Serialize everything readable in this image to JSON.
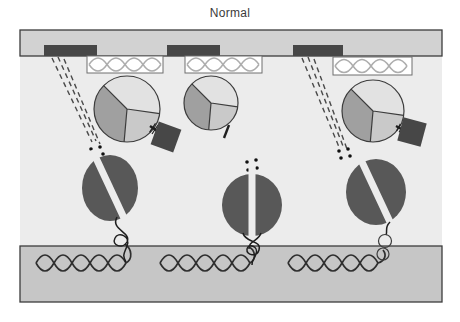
{
  "title": "Normal",
  "colors": {
    "page": "#ffffff",
    "interior": "#ececec",
    "membrane-bar": "#d2d2d2",
    "nucleus-bar": "#c6c6c6",
    "outline": "#3c3c3c",
    "dark-element": "#474747",
    "ribosome": "#585858",
    "pie-top": "#e2e2e2",
    "pie-left": "#a0a0a0",
    "pie-bottom": "#c9c9c9",
    "wave": "#adadad",
    "helix": "#2f2f2f",
    "dash": "#4a4a4a",
    "dot": "#111111",
    "title-text": "#3a3a3a"
  }
}
